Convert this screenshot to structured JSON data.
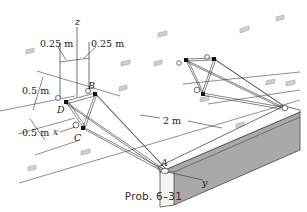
{
  "figure": {
    "caption": "Prob. 6–31",
    "axes": {
      "z": "z",
      "x": "x",
      "y": "y"
    },
    "points": {
      "A": "A",
      "B": "B",
      "C": "C",
      "D": "D"
    },
    "dimensions": {
      "left_offset": "0.25 m",
      "right_offset": "0.25 m",
      "upper_spacing": "0.5 m",
      "lower_spacing": "0.5 m",
      "truss_length": "2 m"
    },
    "colors": {
      "wall_face": "#a9a9a9",
      "wall_top": "#ffffff",
      "lines": "#333333",
      "joint_pin": "#111111",
      "wall_plates": "#c8c8c8"
    }
  }
}
